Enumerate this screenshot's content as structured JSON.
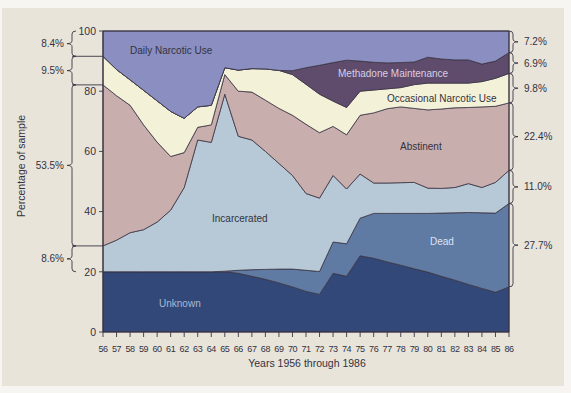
{
  "chart_data": {
    "type": "area",
    "stacked": true,
    "stack_order": "bottom-to-top",
    "title": "",
    "xlabel": "Years 1956 through 1986",
    "ylabel": "Percentage of sample",
    "ylim": [
      0,
      100
    ],
    "yticks": [
      0,
      20,
      40,
      60,
      80,
      100
    ],
    "grid": false,
    "legend": "inline labels inside areas",
    "categories": [
      "56",
      "57",
      "58",
      "59",
      "60",
      "61",
      "62",
      "63",
      "64",
      "65",
      "66",
      "67",
      "68",
      "69",
      "70",
      "71",
      "72",
      "73",
      "74",
      "75",
      "76",
      "77",
      "78",
      "79",
      "80",
      "81",
      "82",
      "83",
      "84",
      "85",
      "86"
    ],
    "series": [
      {
        "name": "Unknown",
        "color": "#324878",
        "values": [
          20,
          20,
          20,
          20,
          20,
          20,
          20,
          20,
          20,
          20,
          19.5,
          18.5,
          17.5,
          16.3,
          15,
          13.5,
          12.5,
          19.5,
          18.5,
          25.3,
          24.5,
          23.3,
          22.2,
          21,
          19.9,
          18.5,
          17.2,
          15.8,
          14.5,
          13.2,
          15
        ]
      },
      {
        "name": "Dead",
        "color": "#5f7aa3",
        "values": [
          0,
          0,
          0,
          0,
          0,
          0,
          0,
          0,
          0,
          0.2,
          1,
          2.2,
          3.3,
          4.6,
          5.9,
          7,
          7.6,
          10.4,
          10.8,
          12.5,
          14.9,
          16.1,
          17.2,
          18.4,
          19.5,
          21,
          22.4,
          23.9,
          25.1,
          26.3,
          27.7
        ]
      },
      {
        "name": "Incarcerated",
        "color": "#b7c9d6",
        "values": [
          8.6,
          10.5,
          13,
          14,
          16.5,
          20.5,
          28,
          43.8,
          43,
          58.8,
          44.5,
          43.1,
          39.2,
          35.1,
          31.1,
          25.5,
          24.4,
          22.1,
          18.2,
          14.7,
          10.1,
          10.1,
          10.2,
          10.3,
          8.4,
          8.2,
          8.4,
          9.6,
          8.4,
          10.2,
          11
        ]
      },
      {
        "name": "Abstinent",
        "color": "#c9aeae",
        "values": [
          53.5,
          48,
          42.3,
          34.8,
          26.6,
          17.8,
          11.6,
          4.2,
          5.8,
          6.5,
          15,
          15.9,
          17,
          18.3,
          20,
          23,
          21.7,
          16.3,
          18,
          19.5,
          23.3,
          24.7,
          25.2,
          24.6,
          26,
          26.4,
          26.5,
          25.3,
          26.8,
          25.3,
          22.4
        ]
      },
      {
        "name": "Occasional Narcotic Use",
        "color": "#f3f1d7",
        "values": [
          9.5,
          8.7,
          8.5,
          11.5,
          13.7,
          15,
          11.4,
          6.8,
          6.5,
          2.3,
          7,
          7.8,
          10.4,
          12.6,
          13.5,
          13.3,
          12.8,
          8.4,
          9.1,
          8,
          7.6,
          6.6,
          6.4,
          7.9,
          8.9,
          8.6,
          8.2,
          8.1,
          8.4,
          9.3,
          9.8
        ]
      },
      {
        "name": "Methadone Maintenance",
        "color": "#5f4b6c",
        "values": [
          0,
          0,
          0,
          0,
          0,
          0,
          0,
          0,
          0,
          0,
          0,
          0,
          0,
          0,
          1.3,
          5.5,
          9.6,
          12.8,
          15.7,
          10,
          9.2,
          8.6,
          8.3,
          7.5,
          8.6,
          8,
          7.7,
          7.7,
          5.8,
          5.7,
          6.9
        ]
      },
      {
        "name": "Daily Narcotic Use",
        "color": "#8a8ec0",
        "values": [
          8.4,
          12.8,
          16.2,
          19.7,
          23.2,
          26.7,
          29,
          25.2,
          24.7,
          12.2,
          13,
          12.5,
          12.6,
          13.1,
          13.2,
          12.2,
          11.4,
          10.5,
          9.7,
          10,
          10.4,
          10.6,
          10.5,
          10.3,
          8.7,
          9.3,
          9.6,
          9.6,
          11,
          10,
          7.2
        ]
      }
    ],
    "annotations": {
      "left_brackets_1956": [
        {
          "label": "8.4%",
          "series": "Daily Narcotic Use",
          "from": 100,
          "to": 91.6
        },
        {
          "label": "9.5%",
          "series": "Occasional Narcotic Use",
          "from": 91.6,
          "to": 82.1
        },
        {
          "label": "53.5%",
          "series": "Abstinent",
          "from": 82.1,
          "to": 28.6
        },
        {
          "label": "8.6%",
          "series": "Incarcerated",
          "from": 28.6,
          "to": 20
        }
      ],
      "right_brackets_1986": [
        {
          "label": "7.2%",
          "series": "Daily Narcotic Use",
          "from": 100,
          "to": 92.8
        },
        {
          "label": "6.9%",
          "series": "Methadone Maintenance",
          "from": 92.8,
          "to": 85.9
        },
        {
          "label": "9.8%",
          "series": "Occasional Narcotic Use",
          "from": 85.9,
          "to": 76.1
        },
        {
          "label": "22.4%",
          "series": "Abstinent",
          "from": 76.1,
          "to": 53.7
        },
        {
          "label": "11.0%",
          "series": "Incarcerated",
          "from": 53.7,
          "to": 42.7
        },
        {
          "label": "27.7%",
          "series": "Dead",
          "from": 42.7,
          "to": 15
        }
      ]
    }
  },
  "colors": {
    "panel_background": "#e8e4da",
    "page_background": "#f6f5f1",
    "line": "#3a3444",
    "text": "#34323f"
  }
}
